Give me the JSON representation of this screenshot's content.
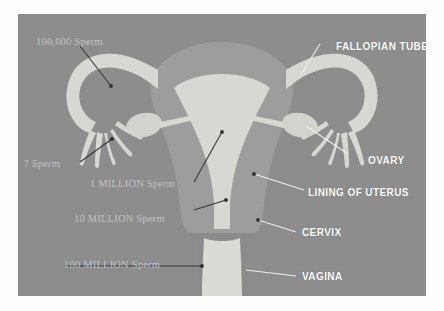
{
  "figure": {
    "kind": "anatomical-diagram",
    "panel": {
      "background_color": "#8d8d8d",
      "margin_color": "#fdfdfc"
    }
  },
  "palette": {
    "panel_background": "#8d8d8d",
    "uterus_wall": "#9e9e9e",
    "uterus_cavity": "#d9d9d4",
    "tube_light": "#d9d9d4",
    "ovary": "#d4d4cf",
    "vagina": "#dcdcd7",
    "anatomy_label_color": "#fdfdfd",
    "sperm_label_color": "#c2c2c2",
    "pointer_line_color": "#3a3a3a",
    "white_pointer_line_color": "#f0f0f0"
  },
  "anatomy_labels": [
    {
      "id": "fallopian-tube",
      "text": "FALLOPIAN TUBE",
      "x": 318,
      "y": 33
    },
    {
      "id": "ovary",
      "text": "OVARY",
      "x": 350,
      "y": 147
    },
    {
      "id": "lining-of-uterus",
      "text": "LINING OF UTERUS",
      "x": 304,
      "y": 179
    },
    {
      "id": "cervix",
      "text": "CERVIX",
      "x": 297,
      "y": 222
    },
    {
      "id": "vagina",
      "text": "VAGINA",
      "x": 297,
      "y": 267
    }
  ],
  "sperm_labels": [
    {
      "id": "sperm-100-thousand",
      "text": "100,000 Sperm",
      "x": 35,
      "y": 36
    },
    {
      "id": "sperm-unknown",
      "text": "? Sperm",
      "x": 24,
      "y": 158
    },
    {
      "id": "sperm-1-million",
      "text": "1 MILLION Sperm",
      "x": 88,
      "y": 177
    },
    {
      "id": "sperm-10-million",
      "text": "10 MILLION Sperm",
      "x": 74,
      "y": 212
    },
    {
      "id": "sperm-100-million",
      "text": "100 MILLION Sperm",
      "x": 63,
      "y": 258
    }
  ],
  "structures": [
    {
      "id": "uterus-body",
      "name": "uterus"
    },
    {
      "id": "uterus-cavity",
      "name": "lining of uterus / endometrial cavity"
    },
    {
      "id": "fallopian-tube-left",
      "name": "left fallopian tube"
    },
    {
      "id": "fallopian-tube-right",
      "name": "right fallopian tube"
    },
    {
      "id": "fimbriae-left",
      "name": "left fimbriae"
    },
    {
      "id": "fimbriae-right",
      "name": "right fimbriae"
    },
    {
      "id": "ovary-left",
      "name": "left ovary"
    },
    {
      "id": "ovary-right",
      "name": "right ovary"
    },
    {
      "id": "cervix",
      "name": "cervix"
    },
    {
      "id": "vagina",
      "name": "vagina"
    }
  ]
}
